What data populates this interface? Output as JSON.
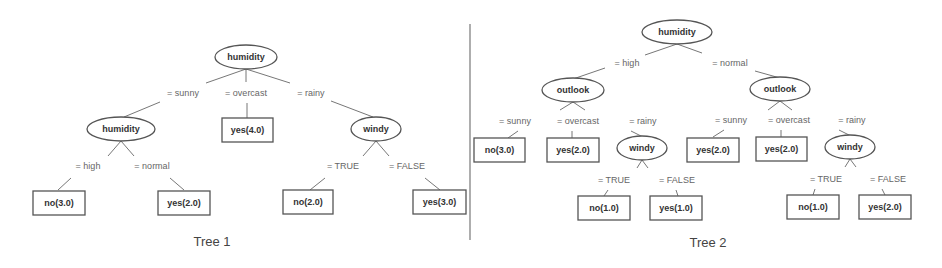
{
  "trees": [
    {
      "caption": "Tree 1",
      "root": {
        "label": "humidity",
        "type": "split"
      },
      "level1_edges": [
        "= sunny",
        "= overcast",
        "= rainy"
      ],
      "level1_nodes": [
        {
          "label": "humidity",
          "type": "split",
          "edges": [
            "= high",
            "= normal"
          ],
          "children": [
            {
              "label": "no(3.0)",
              "type": "leaf"
            },
            {
              "label": "yes(2.0)",
              "type": "leaf"
            }
          ]
        },
        {
          "label": "yes(4.0)",
          "type": "leaf"
        },
        {
          "label": "windy",
          "type": "split",
          "edges": [
            "= TRUE",
            "= FALSE"
          ],
          "children": [
            {
              "label": "no(2.0)",
              "type": "leaf"
            },
            {
              "label": "yes(3.0)",
              "type": "leaf"
            }
          ]
        }
      ]
    },
    {
      "caption": "Tree 2",
      "root": {
        "label": "humidity",
        "type": "split"
      },
      "level1_edges": [
        "= high",
        "= normal"
      ],
      "level1_nodes": [
        {
          "label": "outlook",
          "type": "split",
          "edges": [
            "= sunny",
            "= overcast",
            "= rainy"
          ],
          "children": [
            {
              "label": "no(3.0)",
              "type": "leaf"
            },
            {
              "label": "yes(2.0)",
              "type": "leaf"
            },
            {
              "label": "windy",
              "type": "split",
              "edges": [
                "= TRUE",
                "= FALSE"
              ],
              "children": [
                {
                  "label": "no(1.0)",
                  "type": "leaf"
                },
                {
                  "label": "yes(1.0)",
                  "type": "leaf"
                }
              ]
            }
          ]
        },
        {
          "label": "outlook",
          "type": "split",
          "edges": [
            "= sunny",
            "= overcast",
            "= rainy"
          ],
          "children": [
            {
              "label": "yes(2.0)",
              "type": "leaf"
            },
            {
              "label": "yes(2.0)",
              "type": "leaf"
            },
            {
              "label": "windy",
              "type": "split",
              "edges": [
                "= TRUE",
                "= FALSE"
              ],
              "children": [
                {
                  "label": "no(1.0)",
                  "type": "leaf"
                },
                {
                  "label": "yes(2.0)",
                  "type": "leaf"
                }
              ]
            }
          ]
        }
      ]
    }
  ]
}
